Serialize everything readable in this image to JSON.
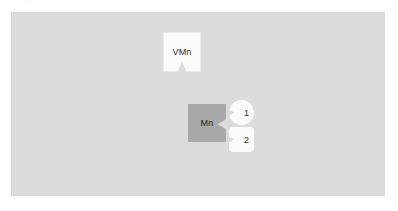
{
  "top_strip": {
    "clipped_text": "..."
  },
  "canvas": {
    "background_color": "#dcdcdc",
    "border_color": "#d6d6d6",
    "nodes": [
      {
        "id": "vmn",
        "label": "VMn",
        "shape": "notched-card-bottom",
        "fill_color": "#fbfbfb",
        "text_color": "#2b2b2b"
      },
      {
        "id": "mn",
        "label": "Mn",
        "shape": "notched-block-right",
        "fill_color": "#a9a9a9",
        "text_color": "#1f1f1f"
      }
    ],
    "badges": [
      {
        "id": "one",
        "label": "1",
        "shape": "notched-circle",
        "fill_color": "#fbfbfb",
        "text_color": "#303030"
      },
      {
        "id": "two",
        "label": "2",
        "shape": "notched-rounded-square",
        "fill_color": "#fbfbfb",
        "text_color": "#303030"
      }
    ]
  }
}
